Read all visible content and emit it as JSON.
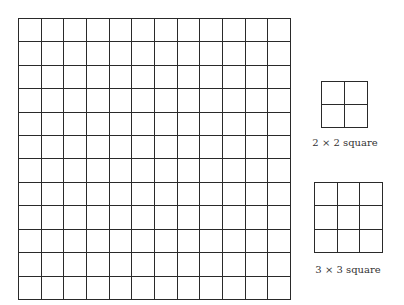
{
  "figure": {
    "main_grid": {
      "rows": 12,
      "cols": 12
    },
    "squares": [
      {
        "size": 2,
        "label": "2 × 2 square"
      },
      {
        "size": 3,
        "label": "3 × 3 square"
      }
    ]
  },
  "colors": {
    "line": "#2a2a2a",
    "background": "#ffffff",
    "text": "#333333"
  }
}
